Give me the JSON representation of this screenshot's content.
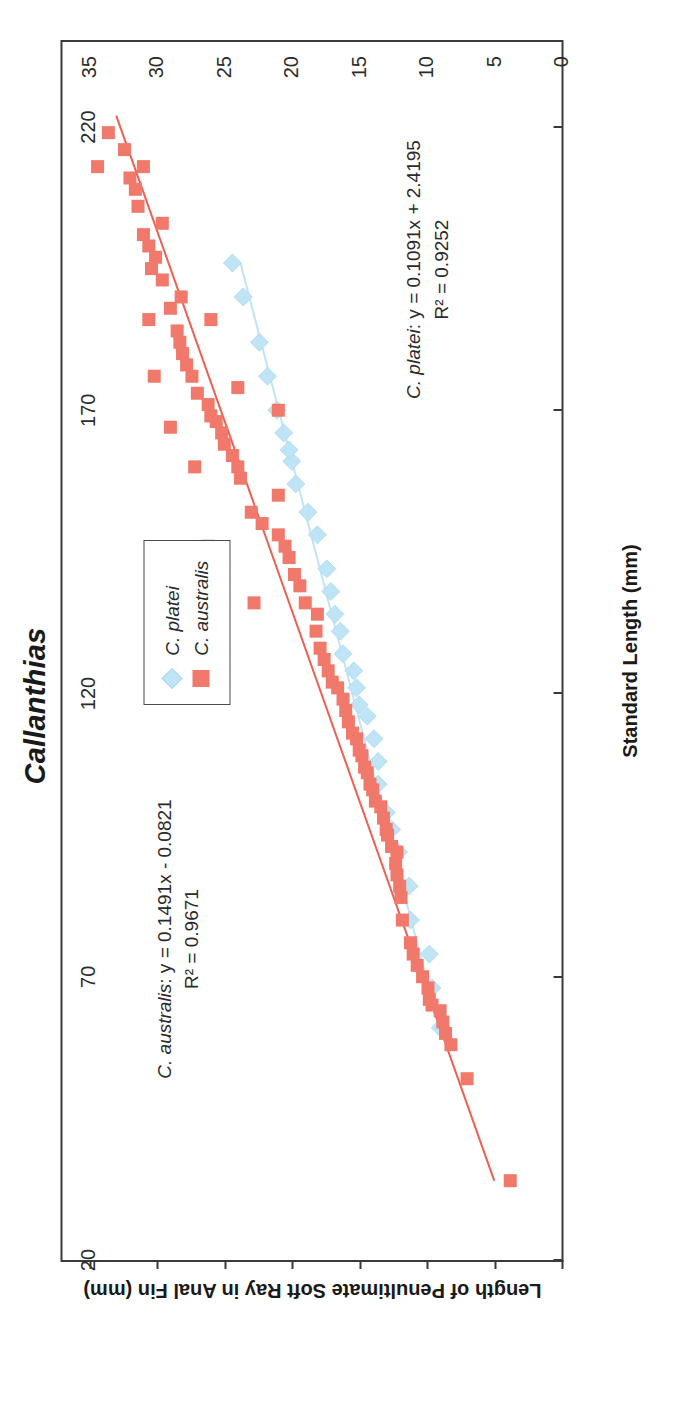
{
  "chart_data": {
    "type": "scatter",
    "title": "Callanthias",
    "xlabel": "Standard Length (mm)",
    "ylabel": "Length of Penultimate Soft Ray in Anal Fin (mm)",
    "xlim": [
      20,
      235
    ],
    "ylim": [
      0,
      37
    ],
    "xticks": [
      20,
      70,
      120,
      170,
      220
    ],
    "yticks": [
      0,
      5,
      10,
      15,
      20,
      25,
      30,
      35
    ],
    "grid": false,
    "legend_position": "right-middle",
    "series": [
      {
        "name": "C. platei",
        "marker": "diamond",
        "color": "#bfe4f5",
        "trendline": {
          "slope": 0.1091,
          "intercept": 2.4195,
          "r2": 0.9252,
          "x_start": 60,
          "x_end": 196,
          "color": "#bfe4f5"
        },
        "points": [
          [
            61,
            9.0
          ],
          [
            68,
            9.6
          ],
          [
            74,
            9.8
          ],
          [
            80,
            11.2
          ],
          [
            86,
            11.3
          ],
          [
            92,
            12.1
          ],
          [
            96,
            12.6
          ],
          [
            99,
            13.0
          ],
          [
            104,
            13.6
          ],
          [
            108,
            13.6
          ],
          [
            112,
            13.9
          ],
          [
            116,
            14.4
          ],
          [
            118,
            15.0
          ],
          [
            121,
            15.2
          ],
          [
            124,
            15.4
          ],
          [
            127,
            16.2
          ],
          [
            131,
            16.4
          ],
          [
            134,
            16.8
          ],
          [
            138,
            17.1
          ],
          [
            142,
            17.4
          ],
          [
            148,
            18.1
          ],
          [
            152,
            18.8
          ],
          [
            157,
            19.7
          ],
          [
            161,
            20.0
          ],
          [
            163,
            20.2
          ],
          [
            166,
            20.6
          ],
          [
            170,
            21.1
          ],
          [
            176,
            21.8
          ],
          [
            182,
            22.4
          ],
          [
            190,
            23.6
          ],
          [
            196,
            24.4
          ]
        ]
      },
      {
        "name": "C. australis",
        "marker": "square",
        "color": "#f1796b",
        "trendline": {
          "slope": 0.1491,
          "intercept": -0.0821,
          "r2": 0.9671,
          "x_start": 34,
          "x_end": 222,
          "color": "#ec6054"
        },
        "points": [
          [
            34,
            3.8
          ],
          [
            52,
            7.0
          ],
          [
            58,
            8.2
          ],
          [
            60,
            8.6
          ],
          [
            62,
            8.8
          ],
          [
            64,
            9.0
          ],
          [
            65,
            9.6
          ],
          [
            66,
            9.8
          ],
          [
            68,
            9.9
          ],
          [
            70,
            10.3
          ],
          [
            72,
            10.7
          ],
          [
            74,
            11.0
          ],
          [
            76,
            11.2
          ],
          [
            80,
            11.8
          ],
          [
            84,
            11.9
          ],
          [
            86,
            12.0
          ],
          [
            88,
            12.2
          ],
          [
            90,
            12.3
          ],
          [
            92,
            12.2
          ],
          [
            93,
            12.6
          ],
          [
            95,
            12.9
          ],
          [
            96,
            13.0
          ],
          [
            98,
            13.2
          ],
          [
            100,
            13.4
          ],
          [
            101,
            13.8
          ],
          [
            103,
            14.0
          ],
          [
            104,
            14.2
          ],
          [
            106,
            14.4
          ],
          [
            107,
            14.6
          ],
          [
            109,
            14.8
          ],
          [
            110,
            15.0
          ],
          [
            112,
            15.2
          ],
          [
            113,
            15.5
          ],
          [
            115,
            15.8
          ],
          [
            117,
            16.0
          ],
          [
            119,
            16.2
          ],
          [
            121,
            16.6
          ],
          [
            122,
            17.0
          ],
          [
            124,
            17.3
          ],
          [
            126,
            17.6
          ],
          [
            128,
            17.9
          ],
          [
            131,
            18.2
          ],
          [
            134,
            18.1
          ],
          [
            136,
            19.0
          ],
          [
            139,
            19.4
          ],
          [
            141,
            19.8
          ],
          [
            144,
            20.2
          ],
          [
            146,
            20.5
          ],
          [
            148,
            21.0
          ],
          [
            150,
            22.2
          ],
          [
            152,
            23.0
          ],
          [
            155,
            21.0
          ],
          [
            158,
            23.8
          ],
          [
            160,
            24.0
          ],
          [
            162,
            24.4
          ],
          [
            164,
            25.0
          ],
          [
            166,
            25.2
          ],
          [
            168,
            25.6
          ],
          [
            169,
            26.0
          ],
          [
            171,
            26.2
          ],
          [
            170,
            21.0
          ],
          [
            173,
            27.0
          ],
          [
            176,
            27.4
          ],
          [
            178,
            27.8
          ],
          [
            180,
            28.1
          ],
          [
            182,
            28.3
          ],
          [
            184,
            28.5
          ],
          [
            186,
            26.0
          ],
          [
            188,
            29.0
          ],
          [
            190,
            28.2
          ],
          [
            193,
            29.6
          ],
          [
            195,
            30.4
          ],
          [
            197,
            30.1
          ],
          [
            199,
            30.6
          ],
          [
            201,
            31.0
          ],
          [
            203,
            29.6
          ],
          [
            206,
            31.4
          ],
          [
            209,
            31.6
          ],
          [
            211,
            32.0
          ],
          [
            213,
            31.0
          ],
          [
            216,
            32.4
          ],
          [
            219,
            33.6
          ],
          [
            213,
            34.4
          ],
          [
            186,
            30.6
          ],
          [
            176,
            30.2
          ],
          [
            167,
            29.0
          ],
          [
            160,
            27.2
          ],
          [
            146,
            26.2
          ],
          [
            136,
            22.8
          ],
          [
            174,
            24.0
          ]
        ]
      }
    ],
    "annotations": [
      {
        "id": "annot-australis",
        "species": "C. australis",
        "line1": ": y = 0.1491x - 0.0821",
        "line2": "R² = 0.9671"
      },
      {
        "id": "annot-platei",
        "species": "C. platei",
        "line1": ": y = 0.1091x + 2.4195",
        "line2": "R² = 0.9252"
      }
    ],
    "legend": [
      {
        "label": "C. platei",
        "marker": "diamond",
        "color": "#bfe4f5"
      },
      {
        "label": "C. australis",
        "marker": "square",
        "color": "#f1796b"
      }
    ]
  }
}
